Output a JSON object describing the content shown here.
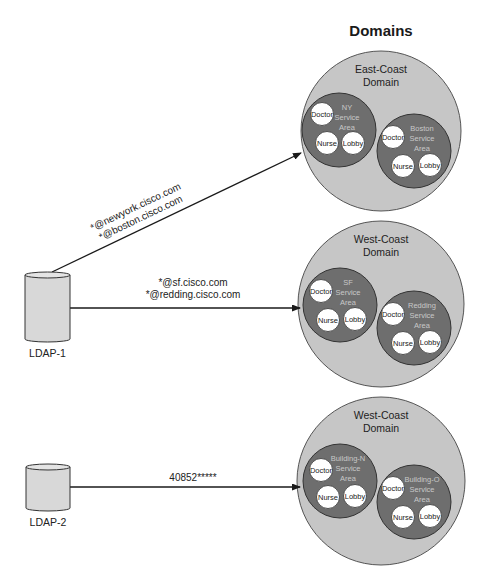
{
  "title": "Domains",
  "colors": {
    "domain_fill": "#c6c6c6",
    "service_area_fill": "#6e6e6e",
    "node_fill": "#ffffff",
    "line": "#1a1a1a",
    "ldap_fill": "#d8d8d8"
  },
  "ldap_servers": [
    {
      "label": "LDAP-1",
      "x": 25,
      "y": 272,
      "w": 45,
      "h": 70,
      "label_y": 357
    },
    {
      "label": "LDAP-2",
      "x": 26,
      "y": 464,
      "w": 44,
      "h": 47,
      "label_y": 526
    }
  ],
  "connections": [
    {
      "from": "LDAP-1",
      "to": "East-Coast Domain",
      "x1": 52,
      "y1": 272,
      "x2": 301,
      "y2": 153,
      "labels": [
        "*@newyork.cisco.com",
        "*@boston.cisco.com"
      ]
    },
    {
      "from": "LDAP-1",
      "to": "West-Coast Domain",
      "x1": 70,
      "y1": 308,
      "x2": 300,
      "y2": 308,
      "labels": [
        "*@sf.cisco.com",
        "*@redding.cisco.com"
      ]
    },
    {
      "from": "LDAP-2",
      "to": "West-Coast Domain (Buildings)",
      "x1": 70,
      "y1": 487,
      "x2": 300,
      "y2": 487,
      "labels": [
        "40852*****"
      ]
    }
  ],
  "domains": [
    {
      "name_line1": "East-Coast",
      "name_line2": "Domain",
      "cx": 381,
      "cy": 131,
      "r": 80,
      "service_areas": [
        {
          "lines": [
            "NY",
            "Service",
            "Area"
          ],
          "cx": 339,
          "cy": 130,
          "r": 37,
          "nodes": [
            {
              "label": "Doctor",
              "dx": -17,
              "dy": -16
            },
            {
              "label": "Nurse",
              "dx": -12,
              "dy": 13
            },
            {
              "label": "Lobby",
              "dx": 14,
              "dy": 13
            }
          ]
        },
        {
          "lines": [
            "Boston",
            "Service",
            "Area"
          ],
          "cx": 414,
          "cy": 151,
          "r": 37,
          "nodes": [
            {
              "label": "Doctor",
              "dx": -21,
              "dy": -14
            },
            {
              "label": "Nurse",
              "dx": -11,
              "dy": 15
            },
            {
              "label": "Lobby",
              "dx": 16,
              "dy": 14
            }
          ]
        }
      ]
    },
    {
      "name_line1": "West-Coast",
      "name_line2": "Domain",
      "cx": 381,
      "cy": 304,
      "r": 83,
      "service_areas": [
        {
          "lines": [
            "SF",
            "Service",
            "Area"
          ],
          "cx": 340,
          "cy": 305,
          "r": 37,
          "nodes": [
            {
              "label": "Doctor",
              "dx": -19,
              "dy": -14
            },
            {
              "label": "Nurse",
              "dx": -12,
              "dy": 15
            },
            {
              "label": "Lobby",
              "dx": 15,
              "dy": 14
            }
          ]
        },
        {
          "lines": [
            "Redding",
            "Service",
            "Area"
          ],
          "cx": 414,
          "cy": 328,
          "r": 37,
          "nodes": [
            {
              "label": "Doctor",
              "dx": -21,
              "dy": -14
            },
            {
              "label": "Nurse",
              "dx": -11,
              "dy": 15
            },
            {
              "label": "Lobby",
              "dx": 16,
              "dy": 14
            }
          ]
        }
      ]
    },
    {
      "name_line1": "West-Coast",
      "name_line2": "Domain",
      "cx": 381,
      "cy": 481,
      "r": 84,
      "service_areas": [
        {
          "lines": [
            "Building-N",
            "Service",
            "Area"
          ],
          "cx": 340,
          "cy": 481,
          "r": 37,
          "nodes": [
            {
              "label": "Doctor",
              "dx": -19,
              "dy": -11
            },
            {
              "label": "Nurse",
              "dx": -12,
              "dy": 16
            },
            {
              "label": "Lobby",
              "dx": 15,
              "dy": 15
            }
          ]
        },
        {
          "lines": [
            "Building-O",
            "Service",
            "Area"
          ],
          "cx": 414,
          "cy": 502,
          "r": 37,
          "nodes": [
            {
              "label": "Doctor",
              "dx": -21,
              "dy": -14
            },
            {
              "label": "Nurse",
              "dx": -11,
              "dy": 15
            },
            {
              "label": "Lobby",
              "dx": 16,
              "dy": 14
            }
          ]
        }
      ]
    }
  ]
}
